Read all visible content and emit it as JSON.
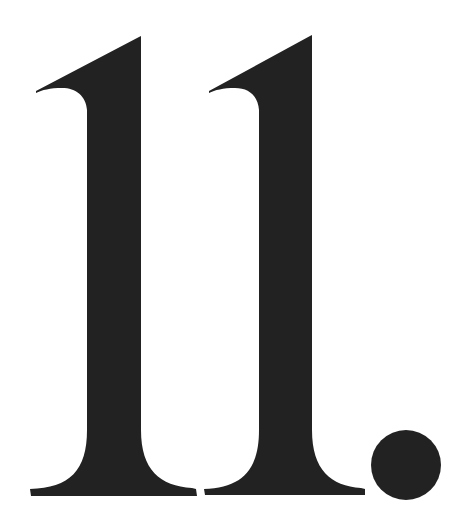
{
  "text": "11.",
  "glyphs": [
    {
      "char": "1",
      "name": "digit-one-first"
    },
    {
      "char": "1",
      "name": "digit-one-second"
    },
    {
      "char": ".",
      "name": "period"
    }
  ],
  "colors": {
    "background": "#ffffff",
    "ink": "#222222"
  }
}
